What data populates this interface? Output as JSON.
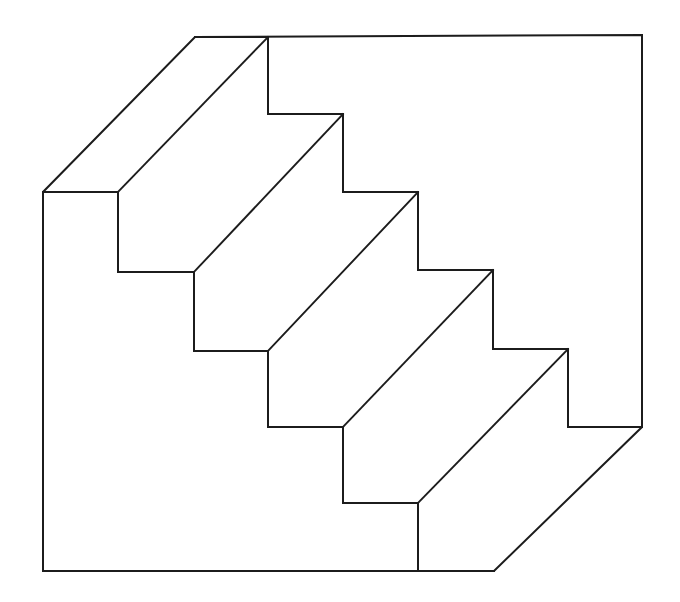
{
  "figure": {
    "name": "schroeder-staircase",
    "kind": "line-drawing",
    "title": "Schroeder staircase optical illusion",
    "description": "Axonometric outline drawing of a five-step staircase that can be perceived either as stairs seen from above or as an overhanging soffit seen from below.",
    "background_color": "#ffffff",
    "line_color": "#1c1c1c",
    "line_width": 2,
    "canvas": {
      "width": 680,
      "height": 602
    },
    "step_count": 5,
    "step_run": 75,
    "step_rise": 78,
    "has_text_labels": false,
    "has_axes": false,
    "has_legend": false
  },
  "geometry": {
    "outer_outline": "195,37 642,35 642,427 494,571 43,571 43,192 195,37",
    "outer_vertices": [
      {
        "name": "top-chamfer-top",
        "x": 195,
        "y": 37
      },
      {
        "name": "top-right-corner",
        "x": 642,
        "y": 35
      },
      {
        "name": "right-chamfer-top",
        "x": 642,
        "y": 427
      },
      {
        "name": "bottom-chamfer-end",
        "x": 494,
        "y": 571
      },
      {
        "name": "bottom-left-corner",
        "x": 43,
        "y": 571
      },
      {
        "name": "left-chamfer-bottom",
        "x": 43,
        "y": 192
      }
    ],
    "upper_step_profile": "195,37 268,37 268,114 343,114 343,192 418,192 418,270 493,270 493,349 568,349 568,427 642,427",
    "lower_step_profile": "43,192 118,192 118,272 194,272 194,351 268,351 268,427 343,427 343,503 418,503 418,571 494,571",
    "tread_diagonals": [
      {
        "name": "diagonal-1",
        "x1": 268,
        "y1": 37,
        "x2": 118,
        "y2": 192
      },
      {
        "name": "diagonal-2",
        "x1": 343,
        "y1": 114,
        "x2": 194,
        "y2": 272
      },
      {
        "name": "diagonal-3",
        "x1": 418,
        "y1": 192,
        "x2": 268,
        "y2": 351
      },
      {
        "name": "diagonal-4",
        "x1": 493,
        "y1": 270,
        "x2": 343,
        "y2": 427
      },
      {
        "name": "diagonal-5",
        "x1": 568,
        "y1": 349,
        "x2": 418,
        "y2": 503
      }
    ],
    "riser_edges": [
      {
        "name": "riser-1",
        "x": 268,
        "y1": 37,
        "y2": 114
      },
      {
        "name": "riser-2",
        "x": 343,
        "y1": 114,
        "y2": 192
      },
      {
        "name": "riser-3",
        "x": 418,
        "y1": 192,
        "y2": 270
      },
      {
        "name": "riser-4",
        "x": 493,
        "y1": 270,
        "y2": 349
      },
      {
        "name": "riser-5",
        "x": 568,
        "y1": 349,
        "y2": 427
      }
    ],
    "tread_edges": [
      {
        "name": "tread-1",
        "y": 37,
        "x1": 195,
        "x2": 268
      },
      {
        "name": "tread-2",
        "y": 114,
        "x1": 268,
        "x2": 343
      },
      {
        "name": "tread-3",
        "y": 192,
        "x1": 343,
        "x2": 418
      },
      {
        "name": "tread-4",
        "y": 270,
        "x1": 418,
        "x2": 493
      },
      {
        "name": "tread-5",
        "y": 349,
        "x1": 493,
        "x2": 568
      }
    ]
  }
}
